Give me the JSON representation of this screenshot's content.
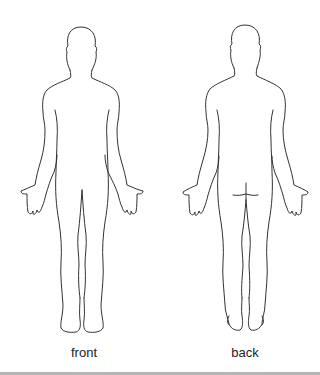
{
  "diagram": {
    "type": "body-outline-chart",
    "figures": [
      {
        "id": "front",
        "label": "front"
      },
      {
        "id": "back",
        "label": "back"
      }
    ],
    "colors": {
      "outline": "#333333",
      "background": "#ffffff",
      "bottom_bar": "#b5b5b5"
    }
  }
}
